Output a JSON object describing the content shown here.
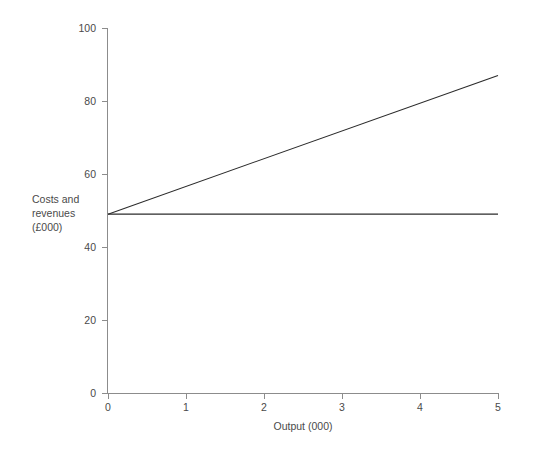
{
  "chart_data": {
    "type": "line",
    "title": "",
    "xlabel": "Output (000)",
    "ylabel": "Costs and revenues (£000)",
    "ylabel_lines": [
      "Costs and",
      "revenues",
      "(£000)"
    ],
    "xlim": [
      0,
      5
    ],
    "ylim": [
      0,
      100
    ],
    "xticks": [
      0,
      1,
      2,
      3,
      4,
      5
    ],
    "yticks": [
      0,
      20,
      40,
      60,
      80,
      100
    ],
    "xticklabels": [
      "0",
      "1",
      "2",
      "3",
      "4",
      "5"
    ],
    "yticklabels": [
      "0",
      "20",
      "40",
      "60",
      "80",
      "100"
    ],
    "grid": false,
    "legend": null,
    "legend_position": "none",
    "line_color": "#2b2b2b",
    "axis_color": "#8c8c8c",
    "background_color": "#ffffff",
    "x": [
      0,
      5
    ],
    "series": [
      {
        "name": "total-revenue-line",
        "values": [
          49,
          87
        ],
        "x": [
          0,
          5
        ],
        "style": "rising-straight-line"
      },
      {
        "name": "fixed-cost-line",
        "values": [
          49,
          49
        ],
        "x": [
          0,
          5
        ],
        "style": "horizontal-straight-line"
      }
    ],
    "intercept": 49,
    "annotations": []
  }
}
